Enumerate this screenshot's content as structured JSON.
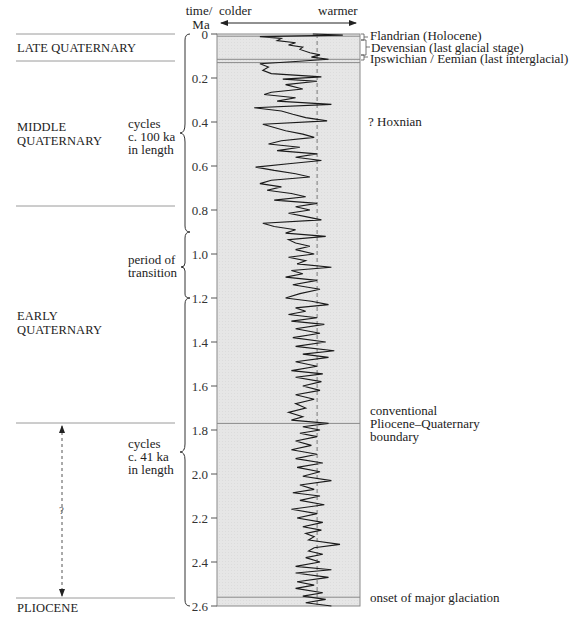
{
  "header": {
    "axis_title_line1": "time/",
    "axis_title_line2": "Ma",
    "colder_label": "colder",
    "warmer_label": "warmer"
  },
  "periods": [
    {
      "label_lines": [
        "LATE QUATERNARY"
      ],
      "from": 0,
      "to": 0.13
    },
    {
      "label_lines": [
        "MIDDLE",
        "QUATERNARY"
      ],
      "from": 0.13,
      "to": 0.78
    },
    {
      "label_lines": [
        "EARLY",
        "QUATERNARY"
      ],
      "from": 0.78,
      "to": 1.77
    },
    {
      "label_lines": [
        "PLIOCENE"
      ],
      "from": 2.58,
      "to": 2.6
    }
  ],
  "brace_annotations": [
    {
      "lines": [
        "cycles",
        "c. 100 ka",
        "in length"
      ],
      "from": 0,
      "to": 0.9
    },
    {
      "lines": [
        "period of",
        "transition"
      ],
      "from": 0.9,
      "to": 1.2
    },
    {
      "lines": [
        "cycles",
        "c. 41 ka",
        "in length"
      ],
      "from": 1.2,
      "to": 2.6
    }
  ],
  "uncertain_arrow": {
    "label": "?",
    "from": 1.77,
    "to": 2.58
  },
  "right_labels": {
    "flandrian": "Flandrian (Holocene)",
    "devensian": "Devensian (last glacial stage)",
    "ipswichian": "Ipswichian / Eemian (last interglacial)",
    "hoxnian": "? Hoxnian",
    "conventional_line1": "conventional",
    "conventional_line2": "Pliocene–Quaternary",
    "conventional_line3": "boundary",
    "onset": "onset of major glaciation"
  },
  "colors": {
    "plot_fill": "#e6e6e6",
    "curve": "#1a1a1a",
    "rule": "#9a9a9a",
    "text": "#222222"
  },
  "chart_data": {
    "type": "line",
    "title": "",
    "ylabel": "time / Ma",
    "xlabel": "colder ← → warmer",
    "ylim": [
      0,
      2.6
    ],
    "y_inverted": true,
    "y_ticks": [
      0,
      0.2,
      0.4,
      0.6,
      0.8,
      1.0,
      1.2,
      1.4,
      1.6,
      1.8,
      2.0,
      2.2,
      2.4,
      2.6
    ],
    "y_tick_labels": [
      "0",
      "0.2",
      "0.4",
      "0.6",
      "0.8",
      "1.0",
      "1.2",
      "1.4",
      "1.6",
      "1.8",
      "2.0",
      "2.2",
      "2.4",
      "2.6"
    ],
    "reference_line": {
      "style": "dashed",
      "x": 0.7,
      "meaning": "present-day level"
    },
    "horizontal_markers": [
      {
        "t": 0.01,
        "label": "Flandrian (Holocene) / Devensian boundary"
      },
      {
        "t": 0.115,
        "label": "Devensian / Ipswichian boundary"
      },
      {
        "t": 0.13,
        "label": "Ipswichian / Eemian base"
      },
      {
        "t": 1.77,
        "label": "conventional Pliocene–Quaternary boundary"
      },
      {
        "t": 2.56,
        "label": "onset of major glaciation"
      }
    ],
    "series": [
      {
        "name": "relative temperature (0 = colder, 1 = warmer)",
        "points": [
          [
            0.0,
            0.67
          ],
          [
            0.005,
            0.88
          ],
          [
            0.012,
            0.3
          ],
          [
            0.02,
            0.45
          ],
          [
            0.03,
            0.42
          ],
          [
            0.04,
            0.55
          ],
          [
            0.05,
            0.5
          ],
          [
            0.06,
            0.6
          ],
          [
            0.07,
            0.58
          ],
          [
            0.085,
            0.65
          ],
          [
            0.095,
            0.72
          ],
          [
            0.105,
            0.66
          ],
          [
            0.115,
            0.78
          ],
          [
            0.125,
            0.55
          ],
          [
            0.135,
            0.3
          ],
          [
            0.15,
            0.36
          ],
          [
            0.165,
            0.32
          ],
          [
            0.18,
            0.38
          ],
          [
            0.195,
            0.73
          ],
          [
            0.205,
            0.46
          ],
          [
            0.215,
            0.7
          ],
          [
            0.23,
            0.48
          ],
          [
            0.25,
            0.6
          ],
          [
            0.265,
            0.38
          ],
          [
            0.275,
            0.33
          ],
          [
            0.29,
            0.55
          ],
          [
            0.305,
            0.42
          ],
          [
            0.32,
            0.8
          ],
          [
            0.335,
            0.26
          ],
          [
            0.35,
            0.45
          ],
          [
            0.365,
            0.53
          ],
          [
            0.38,
            0.62
          ],
          [
            0.395,
            0.77
          ],
          [
            0.41,
            0.32
          ],
          [
            0.425,
            0.4
          ],
          [
            0.44,
            0.48
          ],
          [
            0.455,
            0.6
          ],
          [
            0.47,
            0.68
          ],
          [
            0.485,
            0.45
          ],
          [
            0.5,
            0.36
          ],
          [
            0.515,
            0.58
          ],
          [
            0.53,
            0.42
          ],
          [
            0.545,
            0.7
          ],
          [
            0.56,
            0.55
          ],
          [
            0.575,
            0.73
          ],
          [
            0.59,
            0.5
          ],
          [
            0.605,
            0.27
          ],
          [
            0.62,
            0.4
          ],
          [
            0.635,
            0.55
          ],
          [
            0.65,
            0.65
          ],
          [
            0.665,
            0.38
          ],
          [
            0.68,
            0.3
          ],
          [
            0.695,
            0.45
          ],
          [
            0.71,
            0.35
          ],
          [
            0.725,
            0.52
          ],
          [
            0.74,
            0.62
          ],
          [
            0.755,
            0.4
          ],
          [
            0.77,
            0.7
          ],
          [
            0.785,
            0.55
          ],
          [
            0.8,
            0.65
          ],
          [
            0.815,
            0.5
          ],
          [
            0.83,
            0.62
          ],
          [
            0.845,
            0.73
          ],
          [
            0.86,
            0.32
          ],
          [
            0.875,
            0.4
          ],
          [
            0.89,
            0.55
          ],
          [
            0.905,
            0.48
          ],
          [
            0.92,
            0.76
          ],
          [
            0.935,
            0.5
          ],
          [
            0.95,
            0.55
          ],
          [
            0.965,
            0.65
          ],
          [
            0.98,
            0.55
          ],
          [
            1.0,
            0.68
          ],
          [
            1.015,
            0.5
          ],
          [
            1.03,
            0.62
          ],
          [
            1.045,
            0.56
          ],
          [
            1.06,
            0.8
          ],
          [
            1.075,
            0.52
          ],
          [
            1.09,
            0.6
          ],
          [
            1.105,
            0.48
          ],
          [
            1.12,
            0.7
          ],
          [
            1.14,
            0.53
          ],
          [
            1.16,
            0.72
          ],
          [
            1.18,
            0.58
          ],
          [
            1.2,
            0.48
          ],
          [
            1.215,
            0.66
          ],
          [
            1.23,
            0.78
          ],
          [
            1.245,
            0.55
          ],
          [
            1.26,
            0.62
          ],
          [
            1.275,
            0.5
          ],
          [
            1.29,
            0.7
          ],
          [
            1.305,
            0.52
          ],
          [
            1.32,
            0.75
          ],
          [
            1.34,
            0.55
          ],
          [
            1.36,
            0.72
          ],
          [
            1.38,
            0.53
          ],
          [
            1.4,
            0.76
          ],
          [
            1.42,
            0.55
          ],
          [
            1.44,
            0.82
          ],
          [
            1.455,
            0.6
          ],
          [
            1.47,
            0.78
          ],
          [
            1.49,
            0.55
          ],
          [
            1.51,
            0.7
          ],
          [
            1.53,
            0.52
          ],
          [
            1.545,
            0.74
          ],
          [
            1.56,
            0.55
          ],
          [
            1.58,
            0.73
          ],
          [
            1.6,
            0.6
          ],
          [
            1.62,
            0.72
          ],
          [
            1.64,
            0.55
          ],
          [
            1.66,
            0.68
          ],
          [
            1.68,
            0.55
          ],
          [
            1.7,
            0.62
          ],
          [
            1.72,
            0.5
          ],
          [
            1.74,
            0.6
          ],
          [
            1.755,
            0.52
          ],
          [
            1.77,
            0.78
          ],
          [
            1.785,
            0.6
          ],
          [
            1.8,
            0.72
          ],
          [
            1.815,
            0.58
          ],
          [
            1.83,
            0.7
          ],
          [
            1.85,
            0.55
          ],
          [
            1.87,
            0.66
          ],
          [
            1.89,
            0.52
          ],
          [
            1.91,
            0.7
          ],
          [
            1.93,
            0.55
          ],
          [
            1.95,
            0.74
          ],
          [
            1.97,
            0.56
          ],
          [
            1.99,
            0.72
          ],
          [
            2.01,
            0.6
          ],
          [
            2.03,
            0.8
          ],
          [
            2.05,
            0.58
          ],
          [
            2.07,
            0.68
          ],
          [
            2.085,
            0.53
          ],
          [
            2.1,
            0.72
          ],
          [
            2.12,
            0.58
          ],
          [
            2.14,
            0.75
          ],
          [
            2.16,
            0.52
          ],
          [
            2.18,
            0.7
          ],
          [
            2.2,
            0.56
          ],
          [
            2.22,
            0.74
          ],
          [
            2.24,
            0.6
          ],
          [
            2.255,
            0.73
          ],
          [
            2.27,
            0.62
          ],
          [
            2.285,
            0.68
          ],
          [
            2.3,
            0.64
          ],
          [
            2.32,
            0.86
          ],
          [
            2.335,
            0.68
          ],
          [
            2.35,
            0.64
          ],
          [
            2.365,
            0.74
          ],
          [
            2.38,
            0.62
          ],
          [
            2.4,
            0.72
          ],
          [
            2.42,
            0.55
          ],
          [
            2.435,
            0.8
          ],
          [
            2.45,
            0.55
          ],
          [
            2.47,
            0.78
          ],
          [
            2.49,
            0.56
          ],
          [
            2.505,
            0.68
          ],
          [
            2.52,
            0.55
          ],
          [
            2.54,
            0.74
          ],
          [
            2.555,
            0.6
          ],
          [
            2.57,
            0.76
          ],
          [
            2.585,
            0.62
          ],
          [
            2.6,
            0.8
          ]
        ]
      }
    ]
  }
}
